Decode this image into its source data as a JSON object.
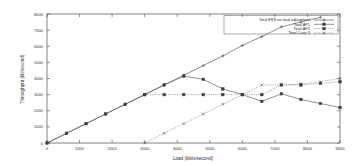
{
  "chart_data": {
    "type": "line",
    "title": "",
    "xlabel": "Load (kbits/second)",
    "ylabel": "Throughput (kb/second)",
    "xlim": [
      0,
      9000
    ],
    "ylim": [
      0,
      8000
    ],
    "xticks": [
      0,
      1000,
      2000,
      3000,
      4000,
      5000,
      6000,
      7000,
      8000,
      9000
    ],
    "yticks": [
      0,
      1000,
      2000,
      3000,
      4000,
      5000,
      6000,
      7000,
      8000
    ],
    "grid": false,
    "legend_position": "top-right",
    "series": [
      {
        "name": "Total ESS no load adjustment",
        "style": "solid-plus",
        "x": [
          0,
          600,
          1200,
          1800,
          2400,
          3000,
          3600,
          4200,
          4800,
          5400,
          6000,
          6600,
          7200,
          7800,
          8400
        ],
        "y": [
          0,
          600,
          1200,
          1800,
          2400,
          3000,
          3600,
          4200,
          4800,
          5400,
          6050,
          6600,
          7200,
          7500,
          7800
        ]
      },
      {
        "name": "Total AP1",
        "style": "solid-square",
        "x": [
          0,
          600,
          1200,
          1800,
          2400,
          3000,
          3600,
          4200,
          4800,
          5400,
          6000,
          6600,
          7200,
          7800,
          8400,
          9000
        ],
        "y": [
          0,
          600,
          1200,
          1800,
          2400,
          3000,
          3600,
          4150,
          3950,
          3350,
          3000,
          2580,
          3050,
          2700,
          2450,
          2200
        ]
      },
      {
        "name": "Total AP2",
        "style": "dotted-square",
        "x": [
          3000,
          3600,
          4200,
          4800,
          5400,
          6000,
          6600,
          7200,
          7800,
          8400,
          9000
        ],
        "y": [
          3000,
          3000,
          3000,
          3000,
          3000,
          3000,
          3000,
          3600,
          3600,
          3700,
          3800
        ]
      },
      {
        "name": "Total Case II",
        "style": "dotted-cross",
        "x": [
          3000,
          3600,
          4200,
          4800,
          5400,
          6000,
          6600,
          7200,
          7800,
          8400,
          9000
        ],
        "y": [
          0,
          600,
          1200,
          1800,
          2400,
          3000,
          3600,
          3600,
          3650,
          3800,
          4000
        ]
      }
    ]
  },
  "legend": {
    "items": [
      {
        "label": "Total ESS no load adjustment",
        "marker": "plus"
      },
      {
        "label": "Total AP1",
        "marker": "square"
      },
      {
        "label": "Total AP2",
        "marker": "square"
      },
      {
        "label": "Total Case II",
        "marker": "cross"
      }
    ]
  },
  "axes": {
    "x_title": "Load (kbits/second)",
    "y_title": "Throughput (kb/second)",
    "x_tick_labels": [
      "0",
      "1000",
      "2000",
      "3000",
      "4000",
      "5000",
      "6000",
      "7000",
      "8000",
      "9000"
    ],
    "y_tick_labels": [
      "0",
      "1000",
      "2000",
      "3000",
      "4000",
      "5000",
      "6000",
      "7000",
      "8000"
    ]
  },
  "colors": {
    "axis": "#4a4a4a",
    "series": "#555555",
    "text": "#2b2b2b",
    "background": "#ffffff"
  }
}
